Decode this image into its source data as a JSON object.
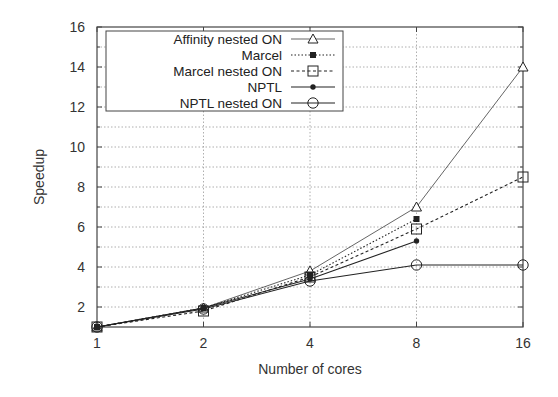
{
  "chart_data": {
    "type": "line",
    "title": "",
    "xlabel": "Number of cores",
    "ylabel": "Speedup",
    "x": [
      1,
      2,
      4,
      8,
      16
    ],
    "x_scale": "log2",
    "x_tick_labels": [
      "1",
      "2",
      "4",
      "8",
      "16"
    ],
    "ylim": [
      1,
      16
    ],
    "y_ticks": [
      2,
      4,
      6,
      8,
      10,
      12,
      14,
      16
    ],
    "y_tick_labels": [
      "2",
      "4",
      "6",
      "8",
      "10",
      "12",
      "14",
      "16"
    ],
    "grid": true,
    "legend_position": "upper left",
    "series": [
      {
        "name": "Affinity nested ON",
        "marker": "open-triangle",
        "line": "solid-thin",
        "values": [
          1.0,
          1.95,
          3.8,
          7.0,
          14.0
        ]
      },
      {
        "name": "Marcel",
        "marker": "filled-square",
        "line": "dotted",
        "values": [
          1.0,
          1.95,
          3.6,
          6.4,
          null
        ]
      },
      {
        "name": "Marcel nested ON",
        "marker": "open-square",
        "line": "dashed",
        "values": [
          1.0,
          1.8,
          3.5,
          5.9,
          8.5
        ]
      },
      {
        "name": "NPTL",
        "marker": "filled-circle",
        "line": "solid",
        "values": [
          1.0,
          1.95,
          3.4,
          5.3,
          null
        ]
      },
      {
        "name": "NPTL nested ON",
        "marker": "open-circle",
        "line": "solid",
        "values": [
          1.0,
          1.9,
          3.3,
          4.1,
          4.1
        ]
      }
    ]
  },
  "axes": {
    "xlabel": "Number of cores",
    "ylabel": "Speedup"
  },
  "legend": {
    "items": [
      {
        "label": "Affinity nested ON"
      },
      {
        "label": "Marcel"
      },
      {
        "label": "Marcel nested ON"
      },
      {
        "label": "NPTL"
      },
      {
        "label": "NPTL nested ON"
      }
    ]
  },
  "colors": {
    "axis": "#444444",
    "grid": "#9a9a9a",
    "line": "#222222",
    "background": "#ffffff"
  }
}
